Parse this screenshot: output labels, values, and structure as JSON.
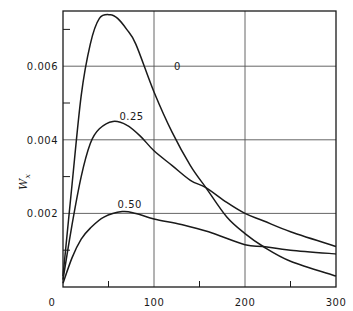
{
  "chart_data": {
    "type": "line",
    "title": "",
    "xlabel": "",
    "ylabel": "W_x",
    "xlim": [
      0,
      300
    ],
    "ylim": [
      0,
      0.0075
    ],
    "grid": true,
    "x_ticks": [
      0,
      100,
      200,
      300
    ],
    "x_tick_labels": [
      "0",
      "100",
      "200",
      "300"
    ],
    "x_minor_ticks": [
      50,
      150,
      250
    ],
    "y_ticks": [
      0,
      0.002,
      0.004,
      0.006
    ],
    "y_tick_labels": [
      "0",
      "0.002",
      "0.004",
      "0.006"
    ],
    "y_minor_ticks": [
      0.001,
      0.003,
      0.005,
      0.007
    ],
    "series": [
      {
        "name": "0",
        "label_pos": [
          122,
          0.0059
        ],
        "x": [
          0,
          10,
          20,
          30,
          40,
          52,
          60,
          70,
          80,
          100,
          120,
          140,
          157,
          180,
          200,
          220,
          250,
          300
        ],
        "y": [
          0.0003,
          0.0028,
          0.0052,
          0.0066,
          0.0073,
          0.0074,
          0.0073,
          0.007,
          0.0066,
          0.0053,
          0.0042,
          0.0033,
          0.0027,
          0.0019,
          0.00145,
          0.0011,
          0.0007,
          0.0003
        ]
      },
      {
        "name": "0.25",
        "label_pos": [
          62,
          0.00455
        ],
        "x": [
          0,
          10,
          20,
          30,
          40,
          55,
          70,
          85,
          100,
          120,
          140,
          157,
          180,
          200,
          220,
          250,
          300
        ],
        "y": [
          0.0002,
          0.0017,
          0.003,
          0.0039,
          0.0043,
          0.0045,
          0.0044,
          0.0041,
          0.0037,
          0.0033,
          0.0029,
          0.0027,
          0.0023,
          0.002,
          0.0018,
          0.0015,
          0.0011
        ]
      },
      {
        "name": "0.50",
        "label_pos": [
          60,
          0.00215
        ],
        "x": [
          0,
          10,
          20,
          30,
          45,
          65,
          80,
          100,
          130,
          160,
          200,
          220,
          250,
          300
        ],
        "y": [
          0.0001,
          0.0008,
          0.0013,
          0.0016,
          0.0019,
          0.00205,
          0.002,
          0.00185,
          0.0017,
          0.0015,
          0.00115,
          0.0011,
          0.001,
          0.0009
        ]
      }
    ]
  }
}
